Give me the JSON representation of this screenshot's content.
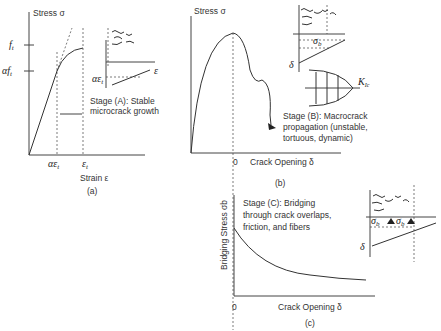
{
  "panel_a": {
    "ylabel": "Stress σ",
    "xlabel": "Strain ε",
    "caption": "(a)",
    "ft": "f",
    "ft_sub": "t",
    "aft": "αf",
    "aft_sub": "t",
    "x_tick1": "αε",
    "x_tick1_sub": "t",
    "x_tick2": "ε",
    "x_tick2_sub": "t",
    "inset_label": "αε",
    "inset_sub": "t",
    "inset_eps": "ε",
    "stage_line1": "Stage (A): Stable",
    "stage_line2": "microcrack growth"
  },
  "panel_b": {
    "ylabel": "Stress σ",
    "xlabel": "Crack Opening δ",
    "x_zero": "0",
    "caption": "(b)",
    "inset_sigma": "σ",
    "inset_sigma_sub": "b",
    "inset_delta": "δ",
    "kic": "K",
    "kic_sub": "Ic",
    "stage_line1": "Stage (B): Macrocrack",
    "stage_line2": "propagation (unstable,",
    "stage_line3": "tortuous, dynamic)"
  },
  "panel_c": {
    "ylabel": "Bridging Stress σb",
    "xlabel": "Crack Opening δ",
    "x_zero": "0",
    "caption": "(c)",
    "inset_sigma": "σ",
    "inset_sigma_sub": "b",
    "inset_delta": "δ",
    "stage_line1": "Stage (C): Bridging",
    "stage_line2": "through crack overlaps,",
    "stage_line3": "friction, and fibers"
  }
}
